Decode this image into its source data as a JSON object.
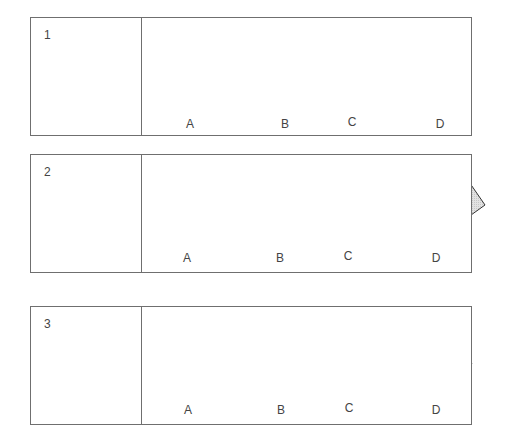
{
  "questions": [
    {
      "number": "1",
      "options": [
        "A",
        "B",
        "C",
        "D"
      ]
    },
    {
      "number": "2",
      "options": [
        "A",
        "B",
        "C",
        "D"
      ]
    },
    {
      "number": "3",
      "options": [
        "A",
        "B",
        "C",
        "D"
      ]
    }
  ],
  "colors": {
    "shape_fill": "#dcdcdc",
    "stroke": "#333333",
    "border": "#6f6f6f"
  }
}
